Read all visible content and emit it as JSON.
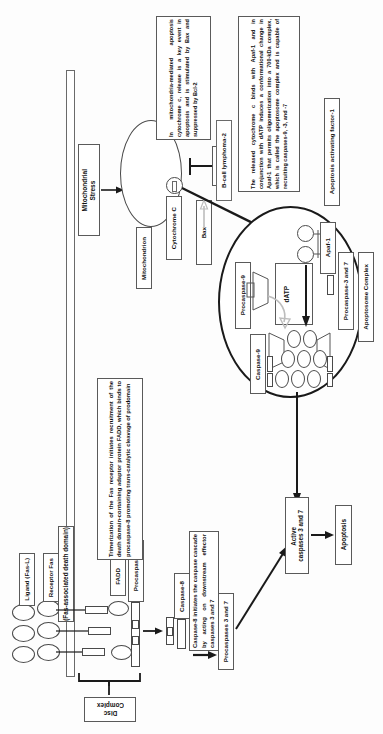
{
  "diagram": {
    "orientation": "rotated-90"
  },
  "annotations": {
    "trimerization": "Trimerization of the Fas receptor initiates recruitment of the death domain-containing adaptor protein FADD, which binds to procaspase-8 promoting trans-catalytic cleavage of prodomain",
    "caspase8_action": "Caspase-8 initiates the caspase cascade by acting on downstream effector caspases 3 and 7",
    "cytochrome_release": "In mitochondria-mediated apoptosis cytochrome c, release is a key event in apoptosis and is stimulated by Bax and suppressed by Bcl-2",
    "apoptosome_formation": "The released cytochrome c binds with Apaf-1 and in conjunction with dATP induces a conformational change in Apaf-1 that permits oligomerization into a 700-kDa complex, which is called the apoptosome complex and is capable of recruiting caspases-9, -3, and -7"
  },
  "labels": {
    "ligand": "Ligand (Fas-L)",
    "receptor": "Receptor Fas",
    "fadd_expansion": "(Fas-associated death domain)",
    "fadd": "FADD",
    "procaspase8": "Procaspase-8",
    "disc_complex": "Disc\nComplex",
    "caspase8": "Caspase-8",
    "procaspases37": "Procaspases 3 and 7",
    "active_caspases": "Active\ncaspases 3 and 7",
    "apoptosis": "Apoptosis",
    "mitochondrial_stress": "Mitochondrial\nStress",
    "mitochondrion": "Mitochondrion",
    "cytochrome_c": "Cytochrome C",
    "bax": "Bax",
    "bcl2": "Bcl-2",
    "bcl2_expansion": "B-cell lymphoma-2",
    "apaf1": "Apaf-1",
    "apaf1_expansion": "Apoptosis activating factor-1",
    "datp": "dATP",
    "procaspase9": "Procaspase-9",
    "caspase9": "Caspase-9",
    "procaspase37": "Procaspase-3 and 7",
    "apoptosome_complex": "Apoptosome Complex"
  },
  "colors": {
    "stroke": "#1a1a1a",
    "box_border": "#5a5a5a",
    "background": "#ffffff",
    "ghost_arrow": "#bdbdbd"
  }
}
